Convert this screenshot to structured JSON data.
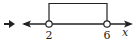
{
  "diagram": {
    "type": "number-line-interval",
    "bullet_icon": "arrow-right-icon",
    "axis_variable": "x",
    "interval": {
      "left": 2,
      "right": 6,
      "left_endpoint": "open",
      "right_endpoint": "open"
    },
    "tick_labels": [
      "2",
      "6"
    ],
    "colors": {
      "line": "#222222",
      "background": "#ffffff"
    }
  }
}
